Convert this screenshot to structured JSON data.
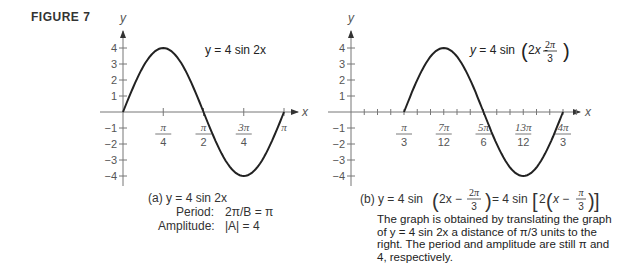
{
  "figure_label": "FIGURE 7",
  "panel_a": {
    "curve_label": "y = 4 sin 2x",
    "axis_y_label": "y",
    "axis_x_label": "x",
    "y_ticks": [
      "4",
      "3",
      "2",
      "1",
      "−1",
      "−2",
      "−3",
      "−4"
    ],
    "x_ticks": [
      {
        "num": "π",
        "den": "4"
      },
      {
        "num": "π",
        "den": "2"
      },
      {
        "num": "3π",
        "den": "4"
      },
      {
        "num": "π",
        "den": ""
      }
    ],
    "caption_title": "(a) y = 4 sin 2x",
    "period_label": "Period:",
    "period_value": "2π/B = π",
    "amplitude_label": "Amplitude:",
    "amplitude_value": "|A| = 4"
  },
  "panel_b": {
    "curve_label": "y = 4 sin(2x − 2π/3)",
    "axis_y_label": "y",
    "axis_x_label": "x",
    "y_ticks": [
      "4",
      "3",
      "2",
      "1",
      "−1",
      "−2",
      "−3",
      "−4"
    ],
    "x_ticks": [
      {
        "num": "π",
        "den": "3"
      },
      {
        "num": "7π",
        "den": "12"
      },
      {
        "num": "5π",
        "den": "6"
      },
      {
        "num": "13π",
        "den": "12"
      },
      {
        "num": "4π",
        "den": "3"
      }
    ],
    "caption": "(b) y = 4 sin(2x − 2π/3) = 4 sin[2(x − π/3)]",
    "note": "The graph is obtained by translating the graph of y = 4 sin 2x a distance of π/3 units to the right. The period and amplitude are still π and 4, respectively."
  },
  "chart_data": [
    {
      "type": "line",
      "title": "(a) y = 4 sin 2x",
      "xlabel": "x",
      "ylabel": "y",
      "x_tick_labels": [
        "π/4",
        "π/2",
        "3π/4",
        "π"
      ],
      "y_tick_labels": [
        "-4",
        "-3",
        "-2",
        "-1",
        "1",
        "2",
        "3",
        "4"
      ],
      "xlim": [
        0,
        3.1416
      ],
      "ylim": [
        -4,
        4
      ],
      "series": [
        {
          "name": "y = 4 sin 2x",
          "x": [
            0,
            0.3927,
            0.7854,
            1.1781,
            1.5708,
            1.9635,
            2.3562,
            2.7489,
            3.1416
          ],
          "y": [
            0,
            2.83,
            4,
            2.83,
            0,
            -2.83,
            -4,
            -2.83,
            0
          ]
        }
      ],
      "annotations": [
        "Period: 2π/B = π",
        "Amplitude: |A| = 4"
      ]
    },
    {
      "type": "line",
      "title": "(b) y = 4 sin(2x − 2π/3) = 4 sin[2(x − π/3)]",
      "xlabel": "x",
      "ylabel": "y",
      "x_tick_labels": [
        "π/3",
        "7π/12",
        "5π/6",
        "13π/12",
        "4π/3"
      ],
      "y_tick_labels": [
        "-4",
        "-3",
        "-2",
        "-1",
        "1",
        "2",
        "3",
        "4"
      ],
      "xlim": [
        0,
        4.1888
      ],
      "ylim": [
        -4,
        4
      ],
      "series": [
        {
          "name": "y = 4 sin(2x − 2π/3)",
          "x": [
            1.0472,
            1.4399,
            1.8326,
            2.2253,
            2.618,
            3.0107,
            3.4034,
            3.7961,
            4.1888
          ],
          "y": [
            0,
            2.83,
            4,
            2.83,
            0,
            -2.83,
            -4,
            -2.83,
            0
          ]
        }
      ]
    }
  ]
}
